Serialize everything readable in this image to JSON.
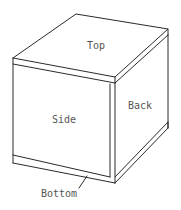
{
  "diagram": {
    "type": "isometric-box",
    "labels": {
      "top": "Top",
      "side": "Side",
      "back": "Back",
      "bottom": "Bottom"
    },
    "colors": {
      "line": "#2a2a2a",
      "text": "#555555",
      "background": "#ffffff"
    }
  }
}
